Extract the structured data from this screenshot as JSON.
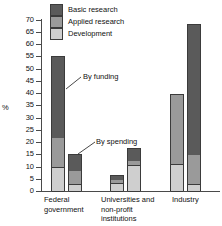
{
  "chart_data": {
    "type": "bar",
    "subtype": "stacked-grouped",
    "title": "",
    "xlabel": "",
    "ylabel": "%",
    "ylim": [
      0,
      70
    ],
    "yticks": [
      0,
      5,
      10,
      15,
      20,
      25,
      30,
      35,
      40,
      45,
      50,
      55,
      60,
      65,
      70
    ],
    "ytick_labels": [
      "0",
      "5",
      "10",
      "15",
      "20",
      "25",
      "30",
      "35",
      "40",
      "45",
      "50",
      "55",
      "60",
      "65",
      "70"
    ],
    "grid": false,
    "legend_position": "top-left-inside",
    "categories": [
      "Federal government",
      "Universities and non-profit institutions",
      "Industry"
    ],
    "subgroups": [
      "By funding",
      "By spending"
    ],
    "series": [
      {
        "name": "Basic research",
        "color": "#5a5a5a",
        "values_by_funding": [
          33.0,
          1.6,
          0.0
        ],
        "values_by_spending": [
          6.4,
          4.9,
          52.8
        ]
      },
      {
        "name": "Applied research",
        "color": "#9a9a9a",
        "values_by_funding": [
          12.2,
          1.7,
          28.5
        ],
        "values_by_spending": [
          5.7,
          2.0,
          12.3
        ]
      },
      {
        "name": "Development",
        "color": "#cfcfcf",
        "values_by_funding": [
          9.8,
          3.3,
          11.0
        ],
        "values_by_spending": [
          2.9,
          10.7,
          2.9
        ]
      }
    ],
    "totals": {
      "by_funding": [
        55.0,
        6.6,
        39.5
      ],
      "by_spending": [
        15.0,
        17.6,
        68.0
      ]
    },
    "annotations": [
      {
        "text": "By funding",
        "points_to": "federal-government-funding-bar"
      },
      {
        "text": "By spending",
        "points_to": "federal-government-spending-bar"
      }
    ]
  },
  "legend": {
    "items": [
      {
        "label": "Basic research",
        "color": "#5a5a5a"
      },
      {
        "label": "Applied research",
        "color": "#9a9a9a"
      },
      {
        "label": "Development",
        "color": "#cfcfcf"
      }
    ]
  },
  "axis": {
    "y_title": "%",
    "y_tick_labels": [
      "70",
      "65",
      "60",
      "55",
      "50",
      "45",
      "40",
      "35",
      "30",
      "25",
      "20",
      "15",
      "10",
      "5",
      "0"
    ]
  },
  "group_labels": [
    {
      "text": "Federal\ngovernment"
    },
    {
      "text": "Universities and\nnon-profit\ninstitutions"
    },
    {
      "text": "Industry"
    }
  ],
  "annotations": {
    "funding": "By funding",
    "spending": "By spending"
  }
}
